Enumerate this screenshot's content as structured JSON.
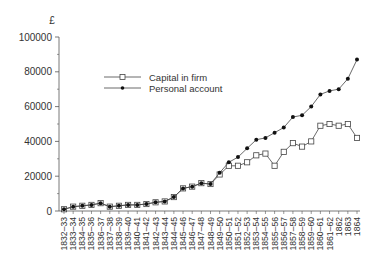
{
  "chart_data": {
    "type": "line",
    "title": "",
    "ylabel": "£",
    "xlabel": "",
    "ylim": [
      0,
      100000
    ],
    "yticks": [
      0,
      20000,
      40000,
      60000,
      80000,
      100000
    ],
    "ytick_labels": [
      "0",
      "20000",
      "40000",
      "60000",
      "80000",
      "100000"
    ],
    "grid": false,
    "legend_position": "upper-left-inside",
    "categories": [
      "1832–33",
      "1833–34",
      "1834–35",
      "1835–36",
      "1836–37",
      "1837–38",
      "1838–39",
      "1839–40",
      "1840–41",
      "1841–42",
      "1842–43",
      "1843–44",
      "1844–45",
      "1845–46",
      "1846–47",
      "1847–48",
      "1848–49",
      "1849–50",
      "1850–51",
      "1851–52",
      "1852–53",
      "1853–54",
      "1854–55",
      "1855–56",
      "1856–57",
      "1857–58",
      "1858–59",
      "1859–60",
      "1860–61",
      "1861–62",
      "1862",
      "1863",
      "1864"
    ],
    "series": [
      {
        "name": "Capital in firm",
        "marker": "open-square",
        "values": [
          1000,
          2500,
          3000,
          3500,
          4500,
          2500,
          3000,
          3500,
          3500,
          4000,
          5000,
          5500,
          8000,
          13000,
          14000,
          16000,
          15500,
          21000,
          26000,
          26000,
          28000,
          32000,
          33000,
          26000,
          34000,
          39000,
          37000,
          40000,
          49000,
          50000,
          49000,
          50000,
          42000
        ]
      },
      {
        "name": "Personal account",
        "marker": "filled-diamond",
        "values": [
          1000,
          2500,
          3000,
          3500,
          4500,
          2500,
          3000,
          3500,
          3500,
          4000,
          5000,
          5500,
          8000,
          13000,
          14000,
          16000,
          15500,
          22000,
          28000,
          31000,
          36000,
          41000,
          42000,
          45000,
          48000,
          54000,
          55000,
          60000,
          67000,
          69000,
          70000,
          76000,
          87000
        ]
      }
    ]
  },
  "legend": {
    "items": [
      {
        "label": "Capital in firm",
        "marker": "open-square-icon"
      },
      {
        "label": "Personal account",
        "marker": "filled-diamond-icon"
      }
    ]
  },
  "axis": {
    "y_unit_label": "£"
  }
}
